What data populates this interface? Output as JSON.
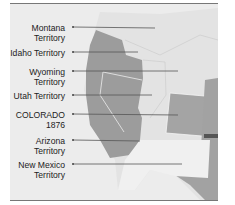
{
  "map": {
    "labels": [
      {
        "line1": "Montana",
        "line2": "Territory",
        "y": 23
      },
      {
        "line1": "Idaho Territory",
        "line2": "",
        "y": 48
      },
      {
        "line1": "Wyoming",
        "line2": "Territory",
        "y": 67
      },
      {
        "line1": "Utah Territory",
        "line2": "",
        "y": 92
      },
      {
        "line1": "COLORADO",
        "line2": "1876",
        "y": 110
      },
      {
        "line1": "Arizona",
        "line2": "Territory",
        "y": 136
      },
      {
        "line1": "New Mexico",
        "line2": "Territory",
        "y": 156
      }
    ],
    "colors": {
      "background": "#ececec",
      "states": "#9a9a9a",
      "territory_light": "#e0e0e0",
      "territory_lighter": "#f2f2f2",
      "borders": "#ffffff",
      "pointer": "#555555"
    }
  }
}
